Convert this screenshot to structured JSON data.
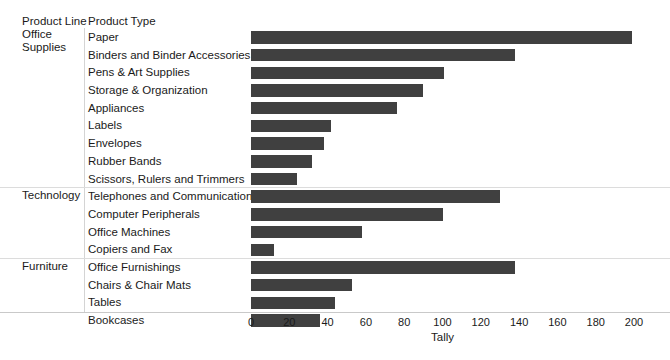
{
  "header": {
    "col_product_line": "Product Line",
    "col_product_type": "Product Type"
  },
  "axis": {
    "title": "Tally",
    "ticks": [
      "0",
      "20",
      "40",
      "60",
      "80",
      "100",
      "120",
      "140",
      "160",
      "180",
      "200"
    ]
  },
  "colors": {
    "bar": "#404040",
    "grid": "#dcdcdc",
    "text": "#1a1a1a"
  },
  "groups": [
    {
      "line": "Office Supplies",
      "line_words": [
        "Office",
        "Supplies"
      ],
      "rows": [
        {
          "type": "Paper",
          "value": 199
        },
        {
          "type": "Binders and Binder Accessories",
          "value": 138
        },
        {
          "type": "Pens & Art Supplies",
          "value": 101
        },
        {
          "type": "Storage & Organization",
          "value": 90
        },
        {
          "type": "Appliances",
          "value": 76
        },
        {
          "type": "Labels",
          "value": 42
        },
        {
          "type": "Envelopes",
          "value": 38
        },
        {
          "type": "Rubber Bands",
          "value": 32
        },
        {
          "type": "Scissors, Rulers and Trimmers",
          "value": 24
        }
      ]
    },
    {
      "line": "Technology",
      "line_words": [
        "Technology"
      ],
      "rows": [
        {
          "type": "Telephones and Communication",
          "value": 130
        },
        {
          "type": "Computer Peripherals",
          "value": 100
        },
        {
          "type": "Office Machines",
          "value": 58
        },
        {
          "type": "Copiers and Fax",
          "value": 12
        }
      ]
    },
    {
      "line": "Furniture",
      "line_words": [
        "Furniture"
      ],
      "rows": [
        {
          "type": "Office Furnishings",
          "value": 138
        },
        {
          "type": "Chairs & Chair Mats",
          "value": 53
        },
        {
          "type": "Tables",
          "value": 44
        },
        {
          "type": "Bookcases",
          "value": 36
        }
      ]
    }
  ],
  "chart_data": {
    "type": "bar",
    "orientation": "horizontal",
    "title": "",
    "xlabel": "Tally",
    "ylabel": "",
    "xlim": [
      0,
      200
    ],
    "xticks": [
      0,
      20,
      40,
      60,
      80,
      100,
      120,
      140,
      160,
      180,
      200
    ],
    "grid": false,
    "legend": "none",
    "group_field": "Product Line",
    "category_field": "Product Type",
    "categories": [
      "Paper",
      "Binders and Binder Accessories",
      "Pens & Art Supplies",
      "Storage & Organization",
      "Appliances",
      "Labels",
      "Envelopes",
      "Rubber Bands",
      "Scissors, Rulers and Trimmers",
      "Telephones and Communication",
      "Computer Peripherals",
      "Office Machines",
      "Copiers and Fax",
      "Office Furnishings",
      "Chairs & Chair Mats",
      "Tables",
      "Bookcases"
    ],
    "groups": [
      "Office Supplies",
      "Office Supplies",
      "Office Supplies",
      "Office Supplies",
      "Office Supplies",
      "Office Supplies",
      "Office Supplies",
      "Office Supplies",
      "Office Supplies",
      "Technology",
      "Technology",
      "Technology",
      "Technology",
      "Furniture",
      "Furniture",
      "Furniture",
      "Furniture"
    ],
    "values": [
      199,
      138,
      101,
      90,
      76,
      42,
      38,
      32,
      24,
      130,
      100,
      58,
      12,
      138,
      53,
      44,
      36
    ]
  }
}
